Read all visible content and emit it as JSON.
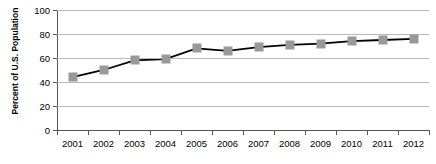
{
  "chart_data": {
    "type": "line",
    "title": "",
    "xlabel": "",
    "ylabel": "Percent of U.S. Population",
    "categories": [
      "2001",
      "2002",
      "2003",
      "2004",
      "2005",
      "2006",
      "2007",
      "2008",
      "2009",
      "2010",
      "2011",
      "2012"
    ],
    "values": [
      44,
      50,
      58,
      59,
      68,
      66,
      69,
      71,
      72,
      74,
      75,
      76
    ],
    "series": [
      {
        "name": "Percent of U.S. Population",
        "values": [
          44,
          50,
          58,
          59,
          68,
          66,
          69,
          71,
          72,
          74,
          75,
          76
        ]
      }
    ],
    "ylim": [
      0,
      100
    ],
    "ytick_labels": [
      "100",
      "80",
      "60",
      "40",
      "20",
      "0"
    ],
    "ytick_values": [
      100,
      80,
      60,
      40,
      20,
      0
    ],
    "grid": true,
    "legend": "none",
    "marker_color": "#999999",
    "line_color": "#000000",
    "grid_color": "#b8b8b8",
    "axis_color": "#555555"
  }
}
